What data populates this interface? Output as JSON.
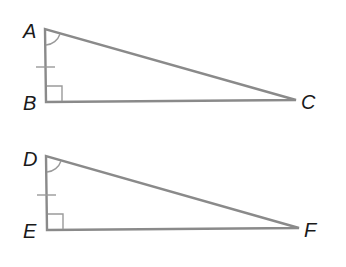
{
  "diagram": {
    "colors": {
      "edge": "#8a8a8a",
      "mark": "#9a9a9a",
      "label": "#1a1a1a",
      "background": "#ffffff"
    },
    "triangles": [
      {
        "name": "ABC",
        "vertices": {
          "top": "A",
          "right_angle": "B",
          "far": "C"
        },
        "right_angle_at": "B",
        "angle_marked_at": "A",
        "tick_marked_side": "AB"
      },
      {
        "name": "DEF",
        "vertices": {
          "top": "D",
          "right_angle": "E",
          "far": "F"
        },
        "right_angle_at": "E",
        "angle_marked_at": "D",
        "tick_marked_side": "DE"
      }
    ]
  }
}
